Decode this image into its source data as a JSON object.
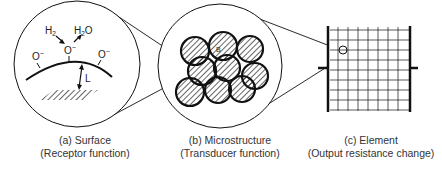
{
  "figure": {
    "panels": [
      {
        "id": "a",
        "title": "(a) Surface",
        "subtitle": "(Receptor function)",
        "labels": {
          "h2": "H",
          "h2_sub": "2",
          "h2o": "H",
          "h2o_sub": "2",
          "h2o_o": "O",
          "oxygen_ion": "O",
          "charge": "−",
          "depletion_length": "L"
        }
      },
      {
        "id": "b",
        "title": "(b) Microstructure",
        "subtitle": "(Transducer function)",
        "labels": {
          "barrier": "B"
        }
      },
      {
        "id": "c",
        "title": "(c) Element",
        "subtitle": "(Output resistance change)"
      }
    ],
    "colors": {
      "line": "#111111",
      "text": "#222222",
      "background": "#ffffff"
    }
  }
}
